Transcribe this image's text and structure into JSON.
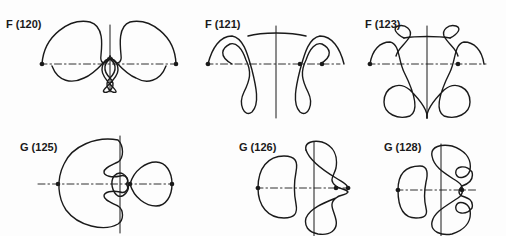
{
  "figure": {
    "panels": [
      {
        "id": "F120",
        "label": "F (120)"
      },
      {
        "id": "F121",
        "label": "F (121)"
      },
      {
        "id": "F123",
        "label": "F (123)"
      },
      {
        "id": "G125",
        "label": "G (125)"
      },
      {
        "id": "G126",
        "label": "G (126)"
      },
      {
        "id": "G128",
        "label": "G (128)"
      }
    ],
    "colors": {
      "ink": "#1a1a1a",
      "paper": "#fdfdfd"
    }
  }
}
